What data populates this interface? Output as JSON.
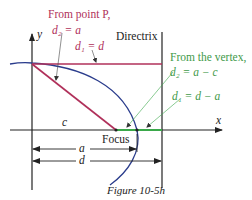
{
  "figure": {
    "caption": "Figure 10-5h",
    "colors": {
      "pink": "#b0305a",
      "green": "#3aa84a",
      "green_text": "#3f9a4a",
      "blue": "#2a3c8c",
      "axis": "#222222"
    },
    "axes": {
      "x_label": "x",
      "y_label": "y"
    },
    "directrix_label": "Directrix",
    "focus_label": "Focus",
    "point_p_note": {
      "line1": "From point P,",
      "eq_d2": "d₂ = a",
      "eq_d1": "d₁ = d"
    },
    "vertex_note": {
      "line1": "From the vertex,",
      "eq_d2": "d₂ = a − c",
      "eq_d1": "d₁ = d − a"
    },
    "dimensions": {
      "c": "c",
      "a": "a",
      "d": "d"
    }
  }
}
